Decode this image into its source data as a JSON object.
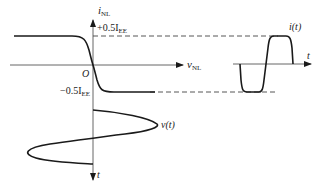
{
  "diagram": {
    "type": "transfer-characteristic-waveform-projection",
    "main_plot": {
      "y_axis_label": "i",
      "y_axis_subscript": "NL",
      "x_axis_label": "v",
      "x_axis_subscript": "NL",
      "origin_label": "O",
      "upper_level_label": "+0.5I",
      "upper_level_subscript": "EE",
      "lower_level_label": "−0.5I",
      "lower_level_subscript": "EE"
    },
    "output_waveform": {
      "label": "i(t)",
      "time_axis_label": "t"
    },
    "input_waveform": {
      "label": "v(t)",
      "time_axis_label": "t"
    },
    "colors": {
      "curve": "#1a1a1a",
      "axis": "#555555",
      "dashed": "#444444"
    }
  }
}
